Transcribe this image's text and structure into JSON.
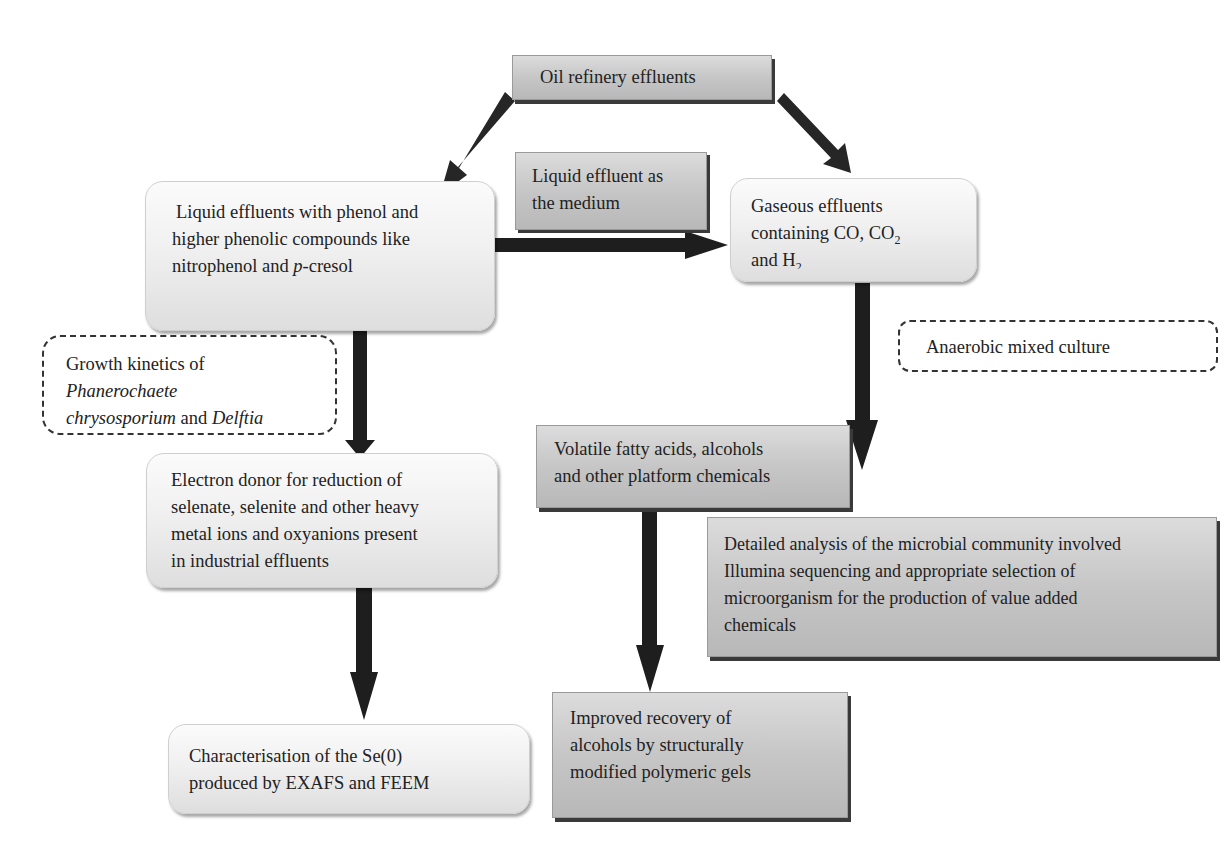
{
  "diagram": {
    "nodes": {
      "oil_refinery": {
        "text": "Oil refinery effluents"
      },
      "liquid_effluents": {
        "line1": "Liquid effluents with phenol and",
        "line2": "higher phenolic compounds like",
        "line3_pre": "nitrophenol and ",
        "line3_italic": "p",
        "line3_post": "-cresol"
      },
      "liquid_medium": {
        "line1": "Liquid effluent as",
        "line2": "the medium"
      },
      "gaseous_effluents": {
        "line1": "Gaseous effluents",
        "line2_pre": "containing CO, CO",
        "line2_sub": "2",
        "line3_pre": "and H",
        "line3_sub": "2"
      },
      "growth_kinetics": {
        "line1": "Growth kinetics of",
        "line2_italic": "Phanerochaete",
        "line3_italic_a": "chrysosporium",
        "line3_mid": " and ",
        "line3_italic_b": "Delftia",
        "line4_italic": "lacustris"
      },
      "anaerobic_culture": {
        "text": "Anaerobic mixed culture"
      },
      "electron_donor": {
        "line1": "Electron donor for reduction of",
        "line2": "selenate, selenite and other heavy",
        "line3": "metal ions and oxyanions present",
        "line4": "in industrial effluents"
      },
      "volatile_fatty_acids": {
        "line1": "Volatile fatty acids, alcohols",
        "line2": "and other platform chemicals"
      },
      "detailed_analysis": {
        "line1": "Detailed analysis of the microbial community involved",
        "line2": "Illumina sequencing and appropriate selection of",
        "line3": "microorganism for the production of value added",
        "line4": "chemicals"
      },
      "characterisation": {
        "line1": "Characterisation of the Se(0)",
        "line2": "produced by EXAFS and FEEM"
      },
      "improved_recovery": {
        "line1": "Improved recovery of",
        "line2": "alcohols by structurally",
        "line3": "modified polymeric gels"
      }
    },
    "edges": [
      {
        "from": "oil_refinery",
        "to": "liquid_effluents"
      },
      {
        "from": "oil_refinery",
        "to": "gaseous_effluents"
      },
      {
        "from": "liquid_effluents",
        "to": "gaseous_effluents",
        "label": "liquid_medium"
      },
      {
        "from": "liquid_effluents",
        "to": "electron_donor",
        "label": "growth_kinetics"
      },
      {
        "from": "gaseous_effluents",
        "to": "volatile_fatty_acids",
        "label": "anaerobic_culture"
      },
      {
        "from": "electron_donor",
        "to": "characterisation"
      },
      {
        "from": "volatile_fatty_acids",
        "to": "improved_recovery"
      }
    ],
    "colors": {
      "arrow": "#1e1e1e",
      "box_gray": "#c4c4c4",
      "box_light": "#f0f0f0"
    }
  }
}
